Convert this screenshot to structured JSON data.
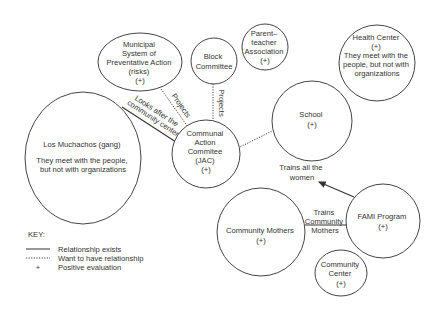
{
  "nodes": {
    "municipal": {
      "lines": [
        "Municipal",
        "System of",
        "Preventative Action",
        "(risks)",
        "(+)"
      ]
    },
    "block": {
      "lines": [
        "Block",
        "Committee"
      ]
    },
    "parent": {
      "lines": [
        "Parent–",
        "teacher",
        "Association",
        "(+)"
      ]
    },
    "health": {
      "lines": [
        "Health Center",
        "(+)",
        "They meet with the",
        "people, but not with",
        "organizations"
      ]
    },
    "school": {
      "lines": [
        "School",
        "(+)"
      ]
    },
    "jac": {
      "lines": [
        "Communal",
        "Action",
        "Commitee",
        "(JAC)",
        "(+)"
      ]
    },
    "muchachos": {
      "lines": [
        "Los Muchachos (gang)",
        "",
        "They meet with the people,",
        "but not with organizations"
      ]
    },
    "mothers": {
      "lines": [
        "Community Mothers",
        "(+)"
      ]
    },
    "fami": {
      "lines": [
        "FAMI Program",
        "(+)"
      ]
    },
    "center": {
      "lines": [
        "Community",
        "Center",
        "(+)"
      ]
    }
  },
  "edges": {
    "muchachos_jac": {
      "type": "solid",
      "label_lines": [
        "Looks after the",
        "community center"
      ]
    },
    "municipal_jac": {
      "type": "dotted",
      "label": "Projects"
    },
    "block_jac": {
      "type": "dotted",
      "label": "Projects"
    },
    "jac_school": {
      "type": "dotted"
    },
    "fami_school": {
      "type": "arrow",
      "label_lines": [
        "Trains all the",
        "women"
      ]
    },
    "fami_mothers": {
      "type": "solid",
      "label_lines": [
        "Trains",
        "Community",
        "Mothers"
      ]
    }
  },
  "key": {
    "title": "KEY:",
    "items": [
      {
        "symbol": "solid-line",
        "label": "Relationship exists"
      },
      {
        "symbol": "dotted-line",
        "label": "Want to have relationship"
      },
      {
        "symbol": "+",
        "label": "Positive evaluation"
      }
    ]
  }
}
